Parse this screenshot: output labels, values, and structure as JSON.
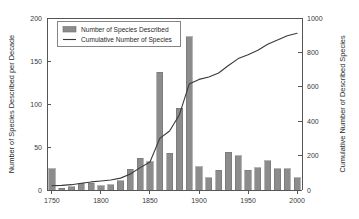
{
  "chart_data": {
    "type": "bar",
    "title": "",
    "subtitle": "",
    "xlabel": "",
    "ylabel": "Number of Species Described per Decade",
    "y2label": "Cumulative Number of Described Species",
    "xlim": [
      1745,
      2005
    ],
    "ylim": [
      0,
      200
    ],
    "y2lim": [
      0,
      1000
    ],
    "grid": false,
    "legend_position": "top-left",
    "x_ticks": [
      1750,
      1800,
      1850,
      1900,
      1950,
      2000
    ],
    "x_tick_labels": [
      "1750",
      "1800",
      "1850",
      "1900",
      "1950",
      "2000"
    ],
    "y_ticks": [
      0,
      50,
      100,
      150,
      200
    ],
    "y_tick_labels": [
      "0",
      "50",
      "100",
      "150",
      "200"
    ],
    "y2_ticks": [
      0,
      200,
      400,
      600,
      800,
      1000
    ],
    "y2_tick_labels": [
      "0",
      "200",
      "400",
      "600",
      "800",
      "1000"
    ],
    "categories": [
      1750,
      1760,
      1770,
      1780,
      1790,
      1800,
      1810,
      1820,
      1830,
      1840,
      1850,
      1860,
      1870,
      1880,
      1890,
      1900,
      1910,
      1920,
      1930,
      1940,
      1950,
      1960,
      1970,
      1980,
      1990,
      2000
    ],
    "series": [
      {
        "name": "Number of Species Described",
        "kind": "bar",
        "axis": "left",
        "color": "#8c8c8c",
        "edge_color": "#6e6e6e",
        "values": [
          25,
          2,
          4,
          8,
          8,
          5,
          6,
          11,
          24,
          37,
          33,
          137,
          43,
          95,
          178,
          27,
          14,
          23,
          44,
          40,
          23,
          26,
          34,
          25,
          25,
          14
        ]
      },
      {
        "name": "Cumulative Number of Species",
        "kind": "line",
        "axis": "right",
        "color": "#3a3a3a",
        "values": [
          25,
          27,
          31,
          39,
          47,
          52,
          58,
          69,
          93,
          130,
          163,
          300,
          343,
          438,
          616,
          643,
          657,
          680,
          724,
          764,
          787,
          813,
          847,
          872,
          897,
          911
        ]
      }
    ],
    "legend_entries": [
      {
        "label": "Number of Species Described",
        "marker": "swatch",
        "color": "#8c8c8c"
      },
      {
        "label": "Cumulative Number of Species",
        "marker": "line",
        "color": "#3a3a3a"
      }
    ]
  }
}
